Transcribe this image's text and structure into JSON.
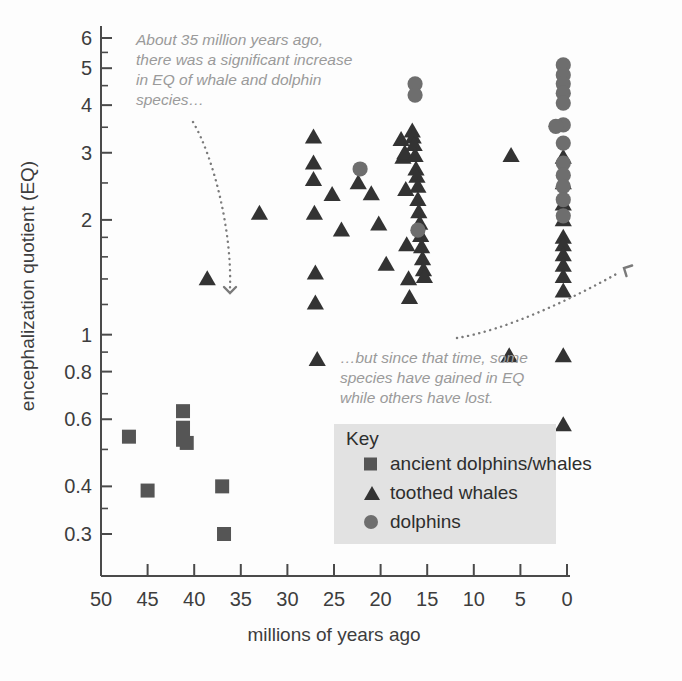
{
  "chart_data": {
    "type": "scatter",
    "title": "",
    "xlabel": "millions of years ago",
    "ylabel": "encephalization quotient (EQ)",
    "xlim": [
      50,
      0
    ],
    "ylim": [
      0.28,
      6.4
    ],
    "x_reversed": true,
    "yscale": "log",
    "grid": false,
    "xticks": [
      50,
      45,
      40,
      35,
      30,
      25,
      20,
      15,
      10,
      5,
      0
    ],
    "xticklabels": [
      "50",
      "45",
      "40",
      "35",
      "30",
      "25",
      "20",
      "15",
      "10",
      "5",
      "0"
    ],
    "yticks": [
      6,
      5,
      4,
      3,
      2,
      1,
      0.8,
      0.6,
      0.4,
      0.3
    ],
    "yticklabels": [
      "6",
      "5",
      "4",
      "3",
      "2",
      "1",
      "0.8",
      "0.6",
      "0.4",
      "0.3"
    ],
    "legend_position": "lower-center-right",
    "legend_title": "Key",
    "series": [
      {
        "name": "ancient dolphins/whales",
        "marker": "square",
        "color": "#555555",
        "points": [
          [
            47.0,
            0.54
          ],
          [
            45.0,
            0.39
          ],
          [
            41.2,
            0.63
          ],
          [
            41.2,
            0.57
          ],
          [
            41.2,
            0.53
          ],
          [
            40.8,
            0.52
          ],
          [
            37.0,
            0.4
          ],
          [
            36.8,
            0.3
          ]
        ]
      },
      {
        "name": "toothed whales",
        "marker": "triangle",
        "color": "#333333",
        "points": [
          [
            38.6,
            1.4
          ],
          [
            33.0,
            2.08
          ],
          [
            27.2,
            3.3
          ],
          [
            27.2,
            2.82
          ],
          [
            27.2,
            2.55
          ],
          [
            27.1,
            2.08
          ],
          [
            27.0,
            1.45
          ],
          [
            27.0,
            1.21
          ],
          [
            26.8,
            0.86
          ],
          [
            25.2,
            2.33
          ],
          [
            24.2,
            1.88
          ],
          [
            22.4,
            2.5
          ],
          [
            21.0,
            2.34
          ],
          [
            20.2,
            1.95
          ],
          [
            19.4,
            1.53
          ],
          [
            17.8,
            3.25
          ],
          [
            17.6,
            2.92
          ],
          [
            17.4,
            3.0
          ],
          [
            17.3,
            2.4
          ],
          [
            17.2,
            1.72
          ],
          [
            17.0,
            1.4
          ],
          [
            16.9,
            1.25
          ],
          [
            16.6,
            3.42
          ],
          [
            16.5,
            3.3
          ],
          [
            16.4,
            3.15
          ],
          [
            16.3,
            2.95
          ],
          [
            16.2,
            2.72
          ],
          [
            16.1,
            2.6
          ],
          [
            16.0,
            2.45
          ],
          [
            16.0,
            2.26
          ],
          [
            15.9,
            2.1
          ],
          [
            15.8,
            1.96
          ],
          [
            15.7,
            1.82
          ],
          [
            15.6,
            1.7
          ],
          [
            15.5,
            1.58
          ],
          [
            15.4,
            1.48
          ],
          [
            15.3,
            1.42
          ],
          [
            6.0,
            2.95
          ],
          [
            6.2,
            0.88
          ],
          [
            0.4,
            2.92
          ],
          [
            0.4,
            2.5
          ],
          [
            0.4,
            2.2
          ],
          [
            0.4,
            2.0
          ],
          [
            0.4,
            1.8
          ],
          [
            0.4,
            1.72
          ],
          [
            0.4,
            1.62
          ],
          [
            0.4,
            1.52
          ],
          [
            0.4,
            1.42
          ],
          [
            0.4,
            1.3
          ],
          [
            0.4,
            0.88
          ],
          [
            0.4,
            0.58
          ]
        ]
      },
      {
        "name": "dolphins",
        "marker": "circle",
        "color": "#6e6e6e",
        "points": [
          [
            22.2,
            2.72
          ],
          [
            16.3,
            4.55
          ],
          [
            16.3,
            4.25
          ],
          [
            16.0,
            1.88
          ],
          [
            0.4,
            5.1
          ],
          [
            0.4,
            4.8
          ],
          [
            0.4,
            4.55
          ],
          [
            0.4,
            4.3
          ],
          [
            0.4,
            4.05
          ],
          [
            0.4,
            3.55
          ],
          [
            1.2,
            3.52
          ],
          [
            0.4,
            3.18
          ],
          [
            0.4,
            2.82
          ],
          [
            0.4,
            2.62
          ],
          [
            0.4,
            2.45
          ],
          [
            0.4,
            2.26
          ],
          [
            0.4,
            2.05
          ]
        ]
      }
    ],
    "annotations": [
      {
        "id": "annot-early",
        "text": "About 35 million years ago,\nthere was a significant increase\nin EQ of whale and dolphin\nspecies…"
      },
      {
        "id": "annot-late",
        "text": "…but since that time, some\nspecies have gained in EQ\nwhile others have lost."
      }
    ]
  },
  "legend": {
    "title": "Key",
    "items": [
      {
        "label": "ancient dolphins/whales",
        "marker": "square"
      },
      {
        "label": "toothed whales",
        "marker": "triangle"
      },
      {
        "label": "dolphins",
        "marker": "circle"
      }
    ]
  },
  "axes": {
    "xlabel": "millions of years ago",
    "ylabel": "encephalization quotient (EQ)"
  },
  "colors": {
    "square": "#555555",
    "triangle": "#333333",
    "circle": "#6e6e6e",
    "axis": "#4a4a4a",
    "annotation": "#9a9a9a",
    "legend_bg": "#e2e2e2"
  }
}
